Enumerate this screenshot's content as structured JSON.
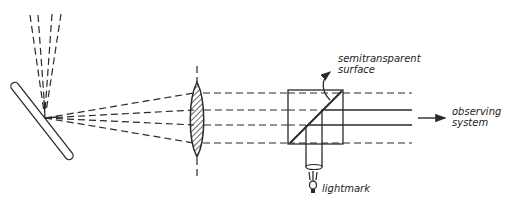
{
  "diagram": {
    "title": "",
    "components": [
      "tilted plate",
      "incident light rays",
      "collimating lens",
      "beam-splitter cube",
      "light tube",
      "lightmark lamp",
      "output arrow"
    ]
  },
  "labels": {
    "semitransparent_line1": "semitransparent",
    "semitransparent_line2": "surface",
    "observing_line1": "observing",
    "observing_line2": "system",
    "lightmark": "lightmark"
  },
  "colors": {
    "ink": "#2a2a2a",
    "background": "#ffffff"
  }
}
